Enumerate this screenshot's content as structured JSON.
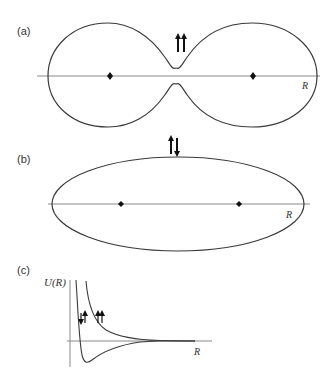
{
  "figure": {
    "panels": [
      {
        "id": "a",
        "label": "(a)",
        "description": "Two-lobed (dumbbell) probability contour with a node between nuclei; parallel spins",
        "spin_state": "parallel",
        "spin_symbol": "↑↑",
        "axis_label": "R",
        "nuclei_count": 2
      },
      {
        "id": "b",
        "label": "(b)",
        "description": "Single elliptical contour enclosing both nuclei; antiparallel spins",
        "spin_state": "antiparallel",
        "spin_symbol": "↑↓",
        "axis_label": "R",
        "nuclei_count": 2
      },
      {
        "id": "c",
        "label": "(c)",
        "description": "Potential energy U(R) versus internuclear separation R",
        "ylabel": "U(R)",
        "xlabel": "R",
        "curves": [
          {
            "name": "antiparallel (bonding)",
            "spin_symbol": "↓↑",
            "shape": "well with minimum"
          },
          {
            "name": "parallel (repulsive)",
            "spin_symbol": "↑↑",
            "shape": "monotonic repulsive"
          }
        ]
      }
    ],
    "colors": {
      "line": "#3a3a3a",
      "axis": "#8a8a8a",
      "dot": "#111111",
      "arrow": "#111111"
    }
  }
}
